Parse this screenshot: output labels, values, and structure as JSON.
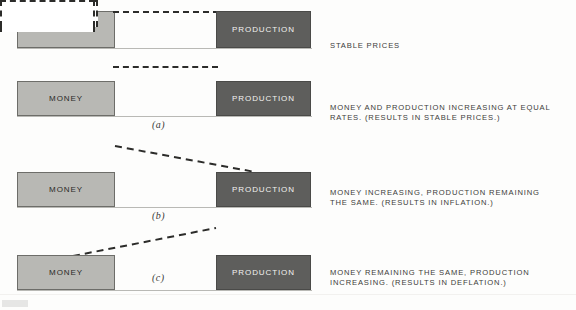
{
  "figure": {
    "kind": "economics-illustration",
    "bar_labels": {
      "money": "MONEY",
      "production": "PRODUCTION"
    },
    "colors": {
      "money_fill": "#b8b8b4",
      "production_fill": "#5e5e5c",
      "ghost_outline": "#2c2c2a",
      "page_bg": "#fdfdfc",
      "caption_text": "#3c3c3a"
    },
    "rows": [
      {
        "id": "row-stable",
        "figure_letter": "",
        "money_label": "MONEY",
        "production_label": "PRODUCTION",
        "caption": "STABLE PRICES",
        "ghost_money": false,
        "ghost_production": false,
        "connector": "horizontal-dashed"
      },
      {
        "id": "row-a",
        "figure_letter": "(a)",
        "money_label": "MONEY",
        "production_label": "PRODUCTION",
        "caption": "MONEY AND PRODUCTION INCREASING AT EQUAL\nRATES. (RESULTS IN STABLE PRICES.)",
        "ghost_money": true,
        "ghost_production": true,
        "connector": "horizontal-dashed"
      },
      {
        "id": "row-b",
        "figure_letter": "(b)",
        "money_label": "MONEY",
        "production_label": "PRODUCTION",
        "caption": "MONEY INCREASING, PRODUCTION REMAINING\nTHE SAME. (RESULTS IN INFLATION.)",
        "ghost_money": true,
        "ghost_production": false,
        "connector": "diagonal-descending"
      },
      {
        "id": "row-c",
        "figure_letter": "(c)",
        "money_label": "MONEY",
        "production_label": "PRODUCTION",
        "caption": "MONEY REMAINING THE SAME, PRODUCTION\nINCREASING. (RESULTS IN DEFLATION.)",
        "ghost_money": false,
        "ghost_production": true,
        "connector": "diagonal-ascending"
      }
    ]
  }
}
